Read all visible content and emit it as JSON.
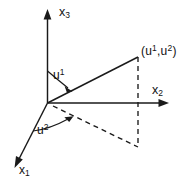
{
  "figure": {
    "background_color": "#ffffff",
    "ink_color": "#1a1a1a",
    "width": 196,
    "height": 184,
    "axes": [
      {
        "id": "x3",
        "label_base": "x",
        "label_sub": "3",
        "direction": "up",
        "arrow": true,
        "style": "solid"
      },
      {
        "id": "x2",
        "label_base": "x",
        "label_sub": "2",
        "direction": "right",
        "arrow": true,
        "style": "solid"
      },
      {
        "id": "x1",
        "label_base": "x",
        "label_sub": "1",
        "direction": "down-left",
        "arrow": true,
        "style": "solid"
      }
    ],
    "angles": [
      {
        "id": "u1",
        "label_base": "u",
        "label_sup": "1",
        "description": "angle from x3 axis down to the solid ray",
        "arc_arrow": true
      },
      {
        "id": "u2",
        "label_base": "u",
        "label_sup": "2",
        "description": "angle from x1 axis up to the dashed projection ray",
        "arc_arrow": true
      }
    ],
    "point": {
      "id": "point-u1-u2",
      "open_paren": "(",
      "first_base": "u",
      "first_sup": "1",
      "separator": ",",
      "second_base": "u",
      "second_sup": "2",
      "close_paren": ")"
    },
    "segments": [
      {
        "id": "solid-ray-to-point",
        "style": "solid",
        "from": "origin",
        "to": "point"
      },
      {
        "id": "dashed-projection-ray",
        "style": "dashed",
        "from": "origin",
        "to": "projection"
      },
      {
        "id": "dashed-vertical-connector",
        "style": "dashed",
        "from": "point",
        "to": "projection"
      }
    ]
  }
}
